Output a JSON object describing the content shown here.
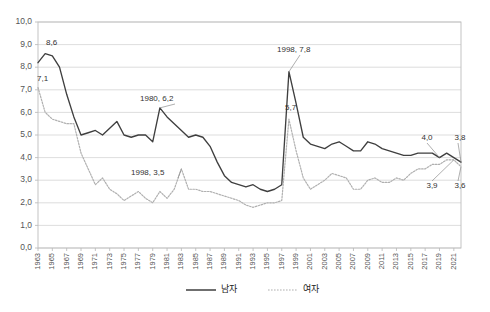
{
  "chart_data": {
    "type": "line",
    "title": "",
    "xlabel": "",
    "ylabel": "",
    "ylim": [
      0.0,
      10.0
    ],
    "ytick_step": 1.0,
    "ytick_labels": [
      "0,0",
      "1,0",
      "2,0",
      "3,0",
      "4,0",
      "5,0",
      "6,0",
      "7,0",
      "8,0",
      "9,0",
      "10,0"
    ],
    "grid": true,
    "legend_position": "bottom-center",
    "decimal_separator": ",",
    "x": [
      1963,
      1964,
      1965,
      1966,
      1967,
      1968,
      1969,
      1970,
      1971,
      1972,
      1973,
      1974,
      1975,
      1976,
      1977,
      1978,
      1979,
      1980,
      1981,
      1982,
      1983,
      1984,
      1985,
      1986,
      1987,
      1988,
      1989,
      1990,
      1991,
      1992,
      1993,
      1994,
      1995,
      1996,
      1997,
      1998,
      1999,
      2000,
      2001,
      2002,
      2003,
      2004,
      2005,
      2006,
      2007,
      2008,
      2009,
      2010,
      2011,
      2012,
      2013,
      2014,
      2015,
      2016,
      2017,
      2018,
      2019,
      2020,
      2021,
      2022
    ],
    "xtick_labels": [
      "1963",
      "1965",
      "1967",
      "1969",
      "1971",
      "1973",
      "1975",
      "1977",
      "1979",
      "1981",
      "1983",
      "1985",
      "1987",
      "1989",
      "1991",
      "1993",
      "1995",
      "1997",
      "1999",
      "2001",
      "2003",
      "2005",
      "2007",
      "2009",
      "2011",
      "2013",
      "2015",
      "2017",
      "2019",
      "2021"
    ],
    "series": [
      {
        "name": "남자",
        "style": "solid",
        "color": "#3f3f3f",
        "values": [
          8.2,
          8.6,
          8.5,
          8.0,
          6.8,
          5.8,
          5.0,
          5.1,
          5.2,
          5.0,
          5.3,
          5.6,
          5.0,
          4.9,
          5.0,
          5.0,
          4.7,
          6.2,
          5.8,
          5.5,
          5.2,
          4.9,
          5.0,
          4.9,
          4.5,
          3.8,
          3.2,
          2.9,
          2.8,
          2.7,
          2.8,
          2.6,
          2.5,
          2.6,
          2.8,
          7.8,
          6.4,
          4.9,
          4.6,
          4.5,
          4.4,
          4.6,
          4.7,
          4.5,
          4.3,
          4.3,
          4.7,
          4.6,
          4.4,
          4.3,
          4.2,
          4.1,
          4.1,
          4.2,
          4.2,
          4.2,
          4.0,
          4.2,
          4.0,
          3.8
        ]
      },
      {
        "name": "여자",
        "style": "dotted",
        "color": "#b0b0b0",
        "values": [
          7.1,
          6.0,
          5.7,
          5.6,
          5.5,
          5.5,
          4.2,
          3.5,
          2.8,
          3.1,
          2.6,
          2.4,
          2.1,
          2.3,
          2.5,
          2.2,
          2.0,
          2.5,
          2.2,
          2.6,
          3.5,
          2.6,
          2.6,
          2.5,
          2.5,
          2.4,
          2.3,
          2.2,
          2.1,
          1.9,
          1.8,
          1.9,
          2.0,
          2.0,
          2.1,
          5.7,
          4.3,
          3.1,
          2.6,
          2.8,
          3.0,
          3.3,
          3.2,
          3.1,
          2.6,
          2.6,
          3.0,
          3.1,
          2.9,
          2.9,
          3.1,
          3.0,
          3.3,
          3.5,
          3.5,
          3.7,
          3.7,
          3.9,
          3.9,
          3.6
        ]
      }
    ],
    "annotations": [
      {
        "name": "male-start-peak",
        "text": "8,6",
        "x": 1964,
        "y": 8.6,
        "leader": false
      },
      {
        "name": "female-start",
        "text": "7,1",
        "x": 1963,
        "y": 7.1,
        "leader": false
      },
      {
        "name": "male-1980",
        "text": "1980, 6,2",
        "x": 1980,
        "y": 6.2,
        "leader": true
      },
      {
        "name": "female-1998",
        "text": "1998, 3,5",
        "x": 1983,
        "y": 3.5,
        "leader": true
      },
      {
        "name": "male-1998",
        "text": "1998, 7,8",
        "x": 1998,
        "y": 7.8,
        "leader": true
      },
      {
        "name": "female-1998-peak",
        "text": "5,7",
        "x": 1998,
        "y": 5.7,
        "leader": false
      },
      {
        "name": "male-2019",
        "text": "4,0",
        "x": 2019,
        "y": 4.0,
        "leader": true
      },
      {
        "name": "male-2022",
        "text": "3,8",
        "x": 2022,
        "y": 3.8,
        "leader": true
      },
      {
        "name": "female-2021",
        "text": "3,9",
        "x": 2021,
        "y": 3.9,
        "leader": true
      },
      {
        "name": "female-2022",
        "text": "3,6",
        "x": 2022,
        "y": 3.6,
        "leader": true
      }
    ]
  },
  "legend": {
    "items": [
      {
        "label": "남자",
        "style": "solid"
      },
      {
        "label": "여자",
        "style": "dotted"
      }
    ]
  }
}
